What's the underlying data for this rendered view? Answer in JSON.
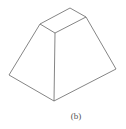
{
  "figure": {
    "caption": "(b)",
    "shape": "truncated pyramid (frustum) line drawing",
    "stroke_color": "#666666",
    "background": "#ffffff",
    "vertices": {
      "top_back": [
        70,
        8
      ],
      "top_right": [
        86,
        17
      ],
      "top_front": [
        55,
        33
      ],
      "top_left": [
        40,
        24
      ],
      "bottom_left": [
        9,
        75
      ],
      "bottom_front": [
        54,
        101
      ],
      "bottom_right": [
        116,
        69
      ]
    }
  }
}
